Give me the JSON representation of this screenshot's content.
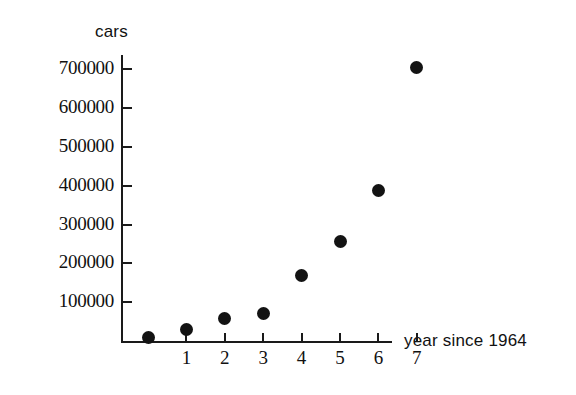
{
  "chart_data": {
    "type": "scatter",
    "title": "",
    "xlabel": "year since 1964",
    "ylabel": "cars",
    "x": [
      0,
      1,
      2,
      3,
      4,
      5,
      6,
      7
    ],
    "values": [
      10000,
      30000,
      57000,
      70000,
      170000,
      257000,
      388000,
      705000
    ],
    "series": [
      {
        "name": "cars",
        "values": [
          10000,
          30000,
          57000,
          70000,
          170000,
          257000,
          388000,
          705000
        ]
      }
    ],
    "x_tick_labels": [
      "1",
      "2",
      "3",
      "4",
      "5",
      "6",
      "7"
    ],
    "x_tick_values": [
      1,
      2,
      3,
      4,
      5,
      6,
      7
    ],
    "y_tick_labels": [
      "100000",
      "200000",
      "300000",
      "400000",
      "500000",
      "600000",
      "700000"
    ],
    "y_tick_values": [
      100000,
      200000,
      300000,
      400000,
      500000,
      600000,
      700000
    ],
    "xlim": [
      -0.35,
      7.6
    ],
    "ylim": [
      0,
      745000
    ],
    "grid": false,
    "legend": "none",
    "marker_color": "#131313",
    "axis_color": "#1a1a1a",
    "background_color": "#ffffff"
  }
}
